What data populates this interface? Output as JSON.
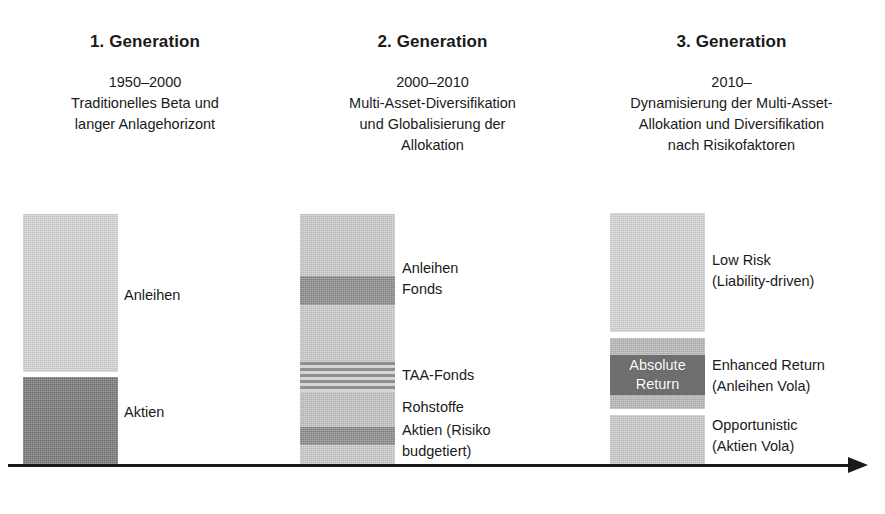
{
  "figure": {
    "kind": "three-generation asset allocation diagram",
    "axis": {
      "name": "time-axis-arrow",
      "direction": "left-to-right"
    }
  },
  "columns": [
    {
      "id": "generation-1",
      "title": "1. Generation",
      "period": "1950–2000",
      "description": "1950–2000\nTraditionelles Beta und\nlanger Anlagehorizont",
      "segments": [
        {
          "id": "g1-anleihen",
          "label": "Anleihen",
          "tone": "#d4d4d4",
          "style": "solid"
        },
        {
          "id": "g1-aktien",
          "label": "Aktien",
          "tone": "#777777",
          "style": "solid"
        }
      ],
      "labels": [
        {
          "id": "g1-label-anleihen",
          "text": "Anleihen"
        },
        {
          "id": "g1-label-aktien",
          "text": "Aktien"
        }
      ]
    },
    {
      "id": "generation-2",
      "title": "2. Generation",
      "period": "2000–2010",
      "description": "2000–2010\nMulti-Asset-Diversifikation\nund Globalisierung der\nAllokation",
      "segments": [
        {
          "id": "g2-band-top",
          "label": "",
          "tone": "#d2d2d2",
          "style": "solid"
        },
        {
          "id": "g2-band-fonds",
          "label": "Anleihen Fonds",
          "tone": "#7d7d7d",
          "style": "solid"
        },
        {
          "id": "g2-band-mid",
          "label": "",
          "tone": "#d0d0d0",
          "style": "solid"
        },
        {
          "id": "g2-band-taa",
          "label": "TAA-Fonds",
          "tone": "#9a9a9a",
          "style": "striped"
        },
        {
          "id": "g2-band-rohstoffe",
          "label": "Rohstoffe",
          "tone": "#c6c6c6",
          "style": "solid"
        },
        {
          "id": "g2-band-aktien",
          "label": "Aktien (Risiko budgetiert)",
          "tone": "#808080",
          "style": "solid"
        },
        {
          "id": "g2-band-bottom",
          "label": "",
          "tone": "#d2d2d2",
          "style": "solid"
        }
      ],
      "labels": [
        {
          "id": "g2-label-anleihen-fonds",
          "text": "Anleihen\nFonds"
        },
        {
          "id": "g2-label-taa",
          "text": "TAA-Fonds"
        },
        {
          "id": "g2-label-rohstoffe",
          "text": "Rohstoffe"
        },
        {
          "id": "g2-label-aktien",
          "text": "Aktien (Risiko\nbudgetiert)"
        }
      ]
    },
    {
      "id": "generation-3",
      "title": "3. Generation",
      "period": "2010–",
      "description": "2010–\nDynamisierung der Multi-Asset-\nAllokation und Diversifikation\nnach Risikofaktoren",
      "segments": [
        {
          "id": "g3-low-risk",
          "label": "Low Risk (Liability-driven)",
          "tone": "#d0d0d0",
          "style": "solid"
        },
        {
          "id": "g3-enhanced-return",
          "label": "Enhanced Return (Anleihen Vola)",
          "tone": "#bcbcbc",
          "style": "solid"
        },
        {
          "id": "g3-opportunistic",
          "label": "Opportunistic (Aktien Vola)",
          "tone": "#c9c9c9",
          "style": "solid"
        }
      ],
      "inset": {
        "id": "g3-absolute-return",
        "text": "Absolute\nReturn",
        "tone": "#6e6e6e",
        "text_color": "#ffffff"
      },
      "labels": [
        {
          "id": "g3-label-low-risk",
          "text": "Low Risk\n(Liability-driven)"
        },
        {
          "id": "g3-label-enhanced",
          "text": "Enhanced Return\n(Anleihen Vola)"
        },
        {
          "id": "g3-label-opportunistic",
          "text": "Opportunistic\n(Aktien Vola)"
        }
      ]
    }
  ]
}
